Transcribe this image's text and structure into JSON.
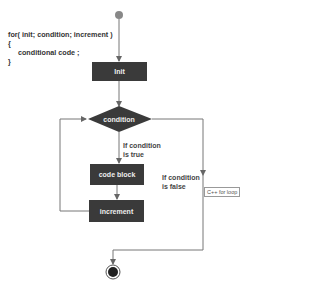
{
  "code": {
    "lines": [
      "for( init; condition; increment )",
      "{",
      "     conditional code ;",
      "}"
    ]
  },
  "nodes": {
    "init": "Init",
    "condition": "condition",
    "code_block": "code block",
    "increment": "increment"
  },
  "labels": {
    "true_branch": [
      "If condition",
      "is true"
    ],
    "false_branch": [
      "If condition",
      "is false"
    ]
  },
  "tag": "C++ for loop",
  "colors": {
    "box": "#3a3a3a",
    "box_text": "#eeeeee",
    "line": "#777777",
    "start": "#888888"
  }
}
